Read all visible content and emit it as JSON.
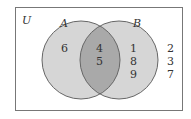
{
  "diagram": {
    "type": "venn",
    "universe_label": "U",
    "sets": [
      {
        "label": "A",
        "only": [
          "6"
        ]
      },
      {
        "label": "B",
        "only": [
          "1",
          "8",
          "9"
        ]
      }
    ],
    "intersection": [
      "4",
      "5"
    ],
    "outside": [
      "2",
      "3",
      "7"
    ],
    "colors": {
      "circle_fill": "#d6d6d6",
      "intersection_fill": "#a9a9a9",
      "stroke": "#666666",
      "border": "#777777"
    }
  }
}
